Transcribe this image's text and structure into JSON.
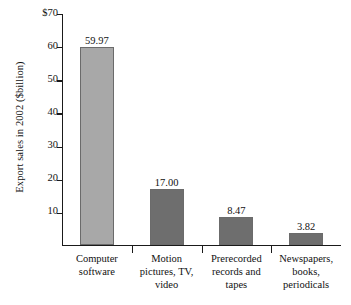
{
  "chart_data": {
    "type": "bar",
    "title": "",
    "xlabel": "",
    "ylabel": "Export sales in 2002 ($billion)",
    "ylim": [
      0,
      70
    ],
    "yticks": [
      "$70",
      "60",
      "50",
      "40",
      "30",
      "20",
      "10"
    ],
    "ytick_values": [
      70,
      60,
      50,
      40,
      30,
      20,
      10
    ],
    "grid": false,
    "legend": "none",
    "categories": [
      "Computer software",
      "Motion pictures, TV, video",
      "Prerecorded records and tapes",
      "Newspapers, books, periodicals"
    ],
    "values": [
      59.97,
      17.0,
      8.47,
      3.82
    ],
    "value_labels": [
      "59.97",
      "17.00",
      "8.47",
      "3.82"
    ],
    "bar_colors": [
      "#a8a8a8",
      "#6e6e6e",
      "#6e6e6e",
      "#6e6e6e"
    ],
    "axis_color": "#1a1a1a"
  },
  "categories_display": [
    {
      "line1": "Computer",
      "line2": "software",
      "line3": ""
    },
    {
      "line1": "Motion",
      "line2": "pictures, TV,",
      "line3": "video"
    },
    {
      "line1": "Prerecorded",
      "line2": "records and",
      "line3": "tapes"
    },
    {
      "line1": "Newspapers,",
      "line2": "books,",
      "line3": "periodicals"
    }
  ]
}
